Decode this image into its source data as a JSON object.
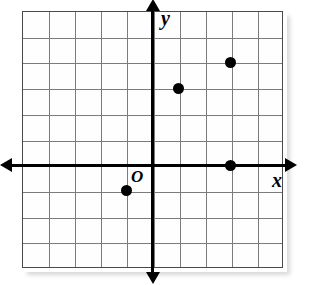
{
  "figure": {
    "type": "coordinate-plane",
    "title": "",
    "background_color": "#ffffff",
    "grid_color": "#7b7b7b",
    "border_color": "#4a4a4a",
    "axis_color": "#000000",
    "point_color": "#000000"
  },
  "labels": {
    "x_axis": "x",
    "y_axis": "y",
    "origin": "O"
  },
  "chart_data": {
    "type": "scatter",
    "title": "",
    "xlabel": "x",
    "ylabel": "y",
    "origin_label": "O",
    "grid": true,
    "legend": "none",
    "xlim": [
      -5,
      5
    ],
    "ylim": [
      -4,
      6
    ],
    "xticks": [
      -5,
      -4,
      -3,
      -2,
      -1,
      0,
      1,
      2,
      3,
      4,
      5
    ],
    "yticks": [
      -4,
      -3,
      -2,
      -1,
      0,
      1,
      2,
      3,
      4,
      5,
      6
    ],
    "tick_labels_shown": false,
    "grid_columns": 10,
    "grid_rows": 10,
    "points": [
      {
        "label": "",
        "x": -1,
        "y": -1
      },
      {
        "label": "",
        "x": 1,
        "y": 3
      },
      {
        "label": "",
        "x": 3,
        "y": 0
      },
      {
        "label": "",
        "x": 3,
        "y": 4
      }
    ]
  },
  "geometry": {
    "plot_left": 22,
    "plot_top": 11,
    "cell_width": 26.1,
    "cell_height": 25.7,
    "origin_col": 5,
    "origin_row": 6
  }
}
